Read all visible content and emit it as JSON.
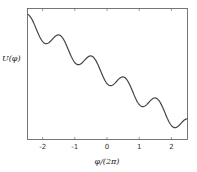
{
  "chart_data": {
    "type": "line",
    "title": "",
    "xlabel": "φ/(2π)",
    "ylabel": "U(φ)",
    "xlim": [
      -2.47,
      2.5
    ],
    "xticks": [
      -2,
      -1,
      0,
      1,
      2
    ],
    "xtick_labels": [
      "-2",
      "-1",
      "0",
      "1",
      "2"
    ],
    "yticks": [],
    "grid": false,
    "legend": null,
    "series": [
      {
        "name": "U(φ)",
        "description": "tilted washboard potential: linear decrease with periodic cosine modulation, period 1 in φ/(2π)",
        "model": {
          "slope": -21,
          "amplitude": 9,
          "phase_shift": 0.05,
          "offset": -75
        },
        "x": [
          -2.47,
          -2.25,
          -2.0,
          -1.75,
          -1.5,
          -1.25,
          -1.0,
          -0.75,
          -0.5,
          -0.25,
          0.0,
          0.25,
          0.5,
          0.75,
          1.0,
          1.25,
          1.5,
          1.75,
          2.0,
          2.25,
          2.5
        ],
        "values": [
          -14,
          -26,
          -42,
          -38,
          -30,
          -42,
          -63,
          -59,
          -52,
          -63,
          -84,
          -80,
          -73,
          -84,
          -105,
          -101,
          -94,
          -105,
          -126,
          -122,
          -119
        ]
      }
    ],
    "local_minima_x": [
      -1.95,
      -0.95,
      0.05,
      1.05,
      2.05
    ],
    "local_maxima_x": [
      -1.45,
      -0.45,
      0.55,
      1.55
    ]
  }
}
